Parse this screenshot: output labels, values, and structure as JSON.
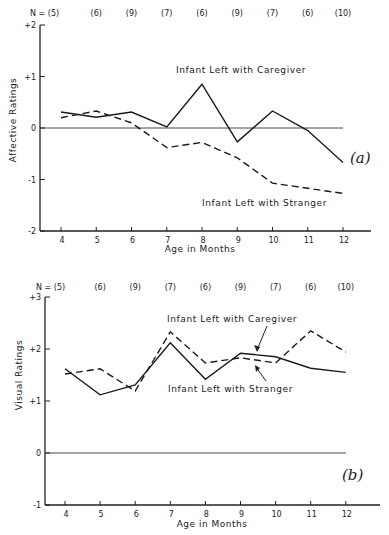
{
  "chart_data": [
    {
      "type": "line",
      "panel": "(a)",
      "title": "",
      "xlabel": "Age in Months",
      "ylabel": "Affective Ratings",
      "x": [
        4,
        5,
        6,
        7,
        8,
        9,
        10,
        11,
        12
      ],
      "x_tick_labels": [
        "4",
        "5",
        "6",
        "7",
        "8",
        "9",
        "10",
        "11",
        "12"
      ],
      "y_tick_labels": [
        "+2",
        "+1",
        "0",
        "-1",
        "-2"
      ],
      "y_ticks": [
        2,
        1,
        0,
        -1,
        -2
      ],
      "ylim": [
        -2,
        2
      ],
      "n_labels": [
        "N = (5)",
        "(6)",
        "(9)",
        "(7)",
        "(6)",
        "(9)",
        "(7)",
        "(6)",
        "(10)"
      ],
      "reference_line": 0,
      "grid": false,
      "legend": "inline labels",
      "series": [
        {
          "name": "Infant Left with Caregiver",
          "style": "solid",
          "values": [
            0.31,
            0.21,
            0.31,
            0.02,
            0.85,
            -0.27,
            0.33,
            -0.05,
            -0.67
          ]
        },
        {
          "name": "Infant Left with Stranger",
          "style": "dashed",
          "values": [
            0.2,
            0.33,
            0.1,
            -0.38,
            -0.28,
            -0.58,
            -1.07,
            -1.17,
            -1.27
          ]
        }
      ]
    },
    {
      "type": "line",
      "panel": "(b)",
      "title": "",
      "xlabel": "Age in Months",
      "ylabel": "Visual Ratings",
      "x": [
        4,
        5,
        6,
        7,
        8,
        9,
        10,
        11,
        12
      ],
      "x_tick_labels": [
        "4",
        "5",
        "6",
        "7",
        "8",
        "9",
        "10",
        "11",
        "12"
      ],
      "y_tick_labels": [
        "+3",
        "+2",
        "+1",
        "0",
        "-1"
      ],
      "y_ticks": [
        3,
        2,
        1,
        0,
        -1
      ],
      "ylim": [
        -1,
        3
      ],
      "n_labels": [
        "N = (5)",
        "(6)",
        "(9)",
        "(7)",
        "(6)",
        "(9)",
        "(7)",
        "(6)",
        "(10)"
      ],
      "reference_line": 0,
      "grid": false,
      "legend": "inline labels with arrows",
      "series": [
        {
          "name": "Infant Left with Caregiver",
          "style": "solid",
          "values": [
            1.62,
            1.12,
            1.31,
            2.12,
            1.42,
            1.92,
            1.85,
            1.63,
            1.55
          ]
        },
        {
          "name": "Infant Left with Stranger",
          "style": "dashed",
          "values": [
            1.52,
            1.62,
            1.19,
            2.33,
            1.73,
            1.83,
            1.73,
            2.35,
            1.94
          ]
        }
      ]
    }
  ]
}
